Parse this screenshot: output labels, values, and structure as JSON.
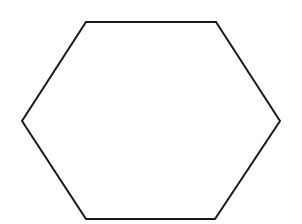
{
  "diagram": {
    "shape": "hexagon",
    "fill": "#ffffff",
    "stroke": "#1a1a1a",
    "stroke_width": 2,
    "vertices": [
      [
        86,
        22
      ],
      [
        216,
        22
      ],
      [
        280,
        121
      ],
      [
        215,
        219
      ],
      [
        86,
        219
      ],
      [
        22,
        121
      ]
    ]
  }
}
